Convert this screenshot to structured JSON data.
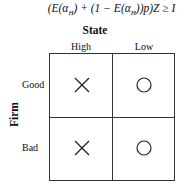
{
  "formula": {
    "text_prefix": "(E(α",
    "sub1": "H",
    "mid": ") + (1 − E(α",
    "sub2": "H",
    "suffix": "))p)Z ≥ I"
  },
  "matrix": {
    "column_axis_title": "State",
    "row_axis_title": "Firm",
    "columns": [
      "High",
      "Low"
    ],
    "rows": [
      "Good",
      "Bad"
    ],
    "cells": [
      [
        {
          "symbol": "cross-icon"
        },
        {
          "symbol": "circle-icon"
        }
      ],
      [
        {
          "symbol": "cross-icon"
        },
        {
          "symbol": "circle-icon"
        }
      ]
    ]
  }
}
